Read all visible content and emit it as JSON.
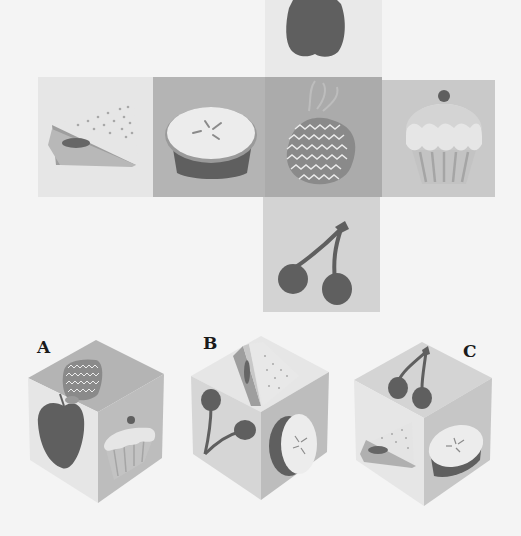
{
  "puzzle": {
    "type": "cube-net",
    "net": {
      "top": {
        "item": "apple",
        "color": "#e9e9e9"
      },
      "row": [
        {
          "item": "sandwich",
          "color": "#e6e6e6"
        },
        {
          "item": "pie",
          "color": "#b4b4b4"
        },
        {
          "item": "pineapple",
          "color": "#ababab"
        },
        {
          "item": "cupcake",
          "color": "#c9c9c9"
        }
      ],
      "bottom": {
        "item": "cherries",
        "color": "#d3d3d3"
      }
    },
    "options": [
      {
        "label": "A",
        "top": "pineapple",
        "left": "apple",
        "right": "cupcake"
      },
      {
        "label": "B",
        "top": "sandwich",
        "left": "cherries",
        "right": "pie"
      },
      {
        "label": "C",
        "top": "cherries",
        "left": "sandwich",
        "right": "pie"
      }
    ]
  },
  "colors": {
    "background": "#f4f4f4",
    "fruit_dark": "#5f5f5f",
    "light_face": "#e8e8e8",
    "mid_face": "#b5b5b5"
  }
}
